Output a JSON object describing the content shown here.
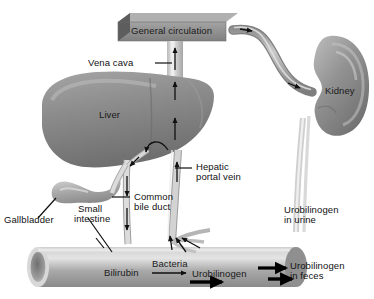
{
  "diagram": {
    "background": "#ffffff"
  },
  "organs": {
    "general_circulation": {
      "label": "General circulation",
      "fill": "#8d8d8d",
      "cap_fill": "#5f5f5f"
    },
    "liver": {
      "label": "Liver",
      "fill": "#8a8a8a"
    },
    "kidney": {
      "label": "Kidney",
      "fill": "#8f8f8f"
    },
    "gallbladder": {
      "label": "Gallbladder",
      "fill": "#b4b4b4"
    },
    "small_intestine": {
      "label": "Small\nintestine",
      "fill": "#a9a9a9"
    }
  },
  "vessels": {
    "vena_cava": {
      "label": "Vena cava",
      "fill": "#d8d8d8"
    },
    "hepatic_portal_vein": {
      "label": "Hepatic\nportal vein",
      "fill": "#c9c9c9"
    },
    "common_bile_duct": {
      "label": "Common\nbile duct",
      "fill": "#cfcfcf"
    },
    "renal_vessel": {
      "fill": "#a0a0a0"
    },
    "ureter": {
      "fill": "#dcdcdc"
    }
  },
  "labels": {
    "general_circulation": "General circulation",
    "vena_cava": "Vena cava",
    "liver": "Liver",
    "kidney": "Kidney",
    "hepatic_portal_vein_l1": "Hepatic",
    "hepatic_portal_vein_l2": "portal vein",
    "common_bile_duct_l1": "Common",
    "common_bile_duct_l2": "bile duct",
    "gallbladder": "Gallbladder",
    "small_intestine_l1": "Small",
    "small_intestine_l2": "intestine",
    "bilirubin": "Bilirubin",
    "bacteria": "Bacteria",
    "urobilinogen": "Urobilinogen",
    "urobilinogen_urine_l1": "Urobilinogen",
    "urobilinogen_urine_l2": "in urine",
    "urobilinogen_feces_l1": "Urobilinogen",
    "urobilinogen_feces_l2": "in feces"
  },
  "colors": {
    "text": "#111111",
    "arrow": "#101010",
    "leader": "#101010"
  }
}
